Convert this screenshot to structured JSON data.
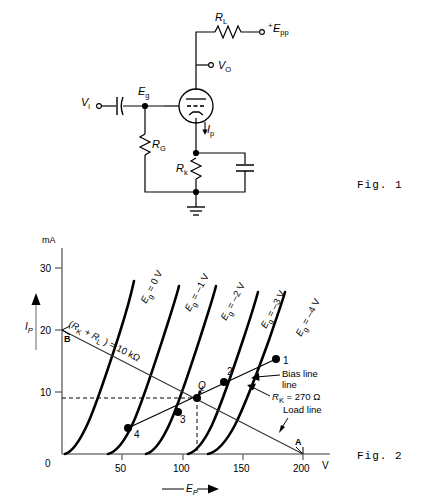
{
  "figure1": {
    "caption": "Fig. 1",
    "labels": {
      "load_resistor": "R",
      "load_resistor_sub": "L",
      "supply": "E",
      "supply_sub": "pp",
      "supply_sign": "+",
      "output": "V",
      "output_sub": "O",
      "input": "V",
      "input_sub": "i",
      "grid": "E",
      "grid_sub": "g",
      "grid_resistor": "R",
      "grid_resistor_sub": "G",
      "cathode_resistor": "R",
      "cathode_resistor_sub": "k",
      "plate_current": "I",
      "plate_current_sub": "p"
    },
    "icon_names": {
      "tube": "vacuum-tube-triode-icon",
      "resistor": "resistor-icon",
      "capacitor": "capacitor-icon",
      "ground": "ground-icon",
      "terminal": "terminal-node-icon",
      "junction": "junction-dot-icon",
      "arrow": "current-arrow-icon"
    }
  },
  "figure2": {
    "caption": "Fig. 2",
    "chart_data": {
      "type": "line",
      "title": "",
      "xlabel": "E_P",
      "ylabel": "I_P",
      "x_unit": "V",
      "y_unit": "mA",
      "xlim": [
        0,
        210
      ],
      "ylim": [
        0,
        33
      ],
      "xticks": [
        0,
        50,
        100,
        150,
        200
      ],
      "yticks": [
        0,
        10,
        20,
        30
      ],
      "grid": false,
      "legend_position": "inline-curve-labels",
      "series": [
        {
          "name": "Eg = 0 V",
          "label": "E_g = 0 V",
          "points": [
            [
              2,
              0
            ],
            [
              5,
              1
            ],
            [
              9,
              3
            ],
            [
              14,
              6
            ],
            [
              20,
              10
            ],
            [
              27,
              15
            ],
            [
              34,
              21
            ],
            [
              41,
              28
            ],
            [
              44,
              31
            ]
          ]
        },
        {
          "name": "Eg = -1 V",
          "label": "E_g = -1 V",
          "points": [
            [
              38,
              0
            ],
            [
              42,
              1
            ],
            [
              47,
              3
            ],
            [
              53,
              6
            ],
            [
              60,
              10
            ],
            [
              67,
              15
            ],
            [
              74,
              21
            ],
            [
              80,
              27
            ],
            [
              83,
              30
            ]
          ]
        },
        {
          "name": "Eg = -2 V",
          "label": "E_g = -2 V",
          "points": [
            [
              70,
              0
            ],
            [
              75,
              1
            ],
            [
              80,
              3
            ],
            [
              87,
              6
            ],
            [
              94,
              10
            ],
            [
              101,
              15
            ],
            [
              108,
              21
            ],
            [
              114,
              27
            ],
            [
              117,
              30
            ]
          ]
        },
        {
          "name": "Eg = -3 V",
          "label": "E_g = -3 V",
          "points": [
            [
              105,
              0
            ],
            [
              110,
              1
            ],
            [
              116,
              3
            ],
            [
              123,
              6
            ],
            [
              130,
              10
            ],
            [
              137,
              15
            ],
            [
              144,
              21
            ],
            [
              150,
              27
            ],
            [
              152,
              29
            ]
          ]
        },
        {
          "name": "Eg = -4 V",
          "label": "E_g = -4 V",
          "points": [
            [
              122,
              0
            ],
            [
              128,
              1
            ],
            [
              135,
              3
            ],
            [
              143,
              6
            ],
            [
              151,
              10
            ],
            [
              159,
              15
            ],
            [
              167,
              21
            ],
            [
              174,
              26
            ],
            [
              178,
              29
            ]
          ]
        }
      ],
      "load_line": {
        "label": "Load line",
        "from": [
          0,
          20
        ],
        "to": [
          200,
          0
        ],
        "endpoint_labels": {
          "top": "B",
          "bottom": "A"
        },
        "annotation": "(R_K + R_L ) = 10 kΩ"
      },
      "bias_line": {
        "label": "Bias line",
        "resistance_label": "R_K = 270 Ω",
        "from": [
          55,
          4.2
        ],
        "to": [
          178,
          15.3
        ]
      },
      "operating_points": [
        {
          "name": "1",
          "x": 178,
          "y": 15.3
        },
        {
          "name": "2",
          "x": 135,
          "y": 11.5
        },
        {
          "name": "Q",
          "x": 112,
          "y": 9.0
        },
        {
          "name": "3",
          "x": 96,
          "y": 6.8
        },
        {
          "name": "4",
          "x": 55,
          "y": 4.2
        }
      ],
      "projection_lines": {
        "q_horizontal_y": 9.0,
        "q_vertical_x": 112,
        "style": "dashed"
      }
    }
  }
}
